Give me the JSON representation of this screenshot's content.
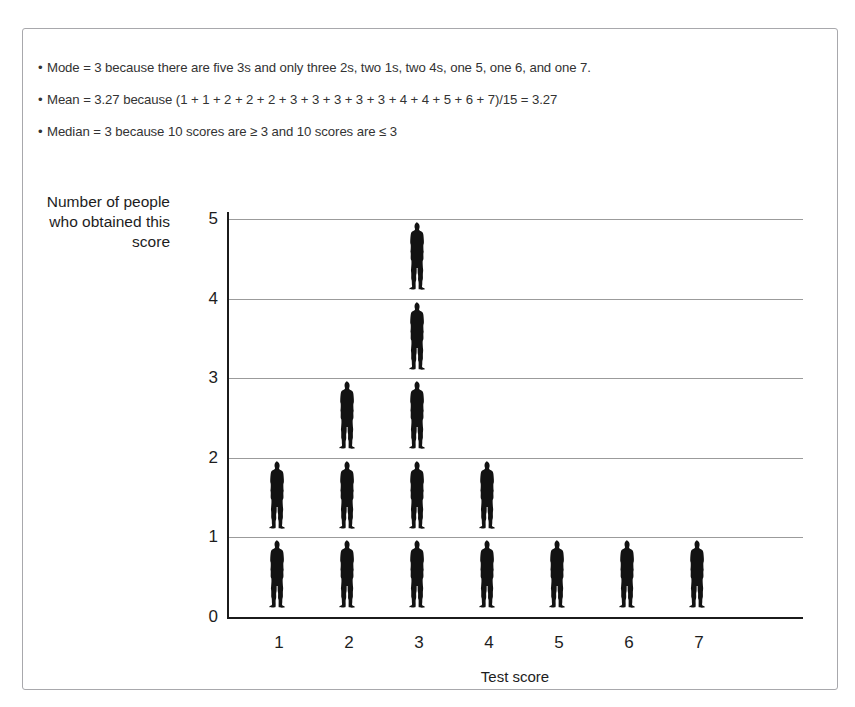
{
  "notes": {
    "bullet_char": "•",
    "items": [
      "Mode = 3 because there are five 3s and only three 2s, two 1s, two 4s, one 5, one 6, and one 7.",
      "Mean = 3.27 because (1 + 1 + 2 + 2 + 2 + 3 + 3 + 3 + 3 + 3 + 4 + 4 + 5 + 6 + 7)/15 = 3.27",
      "Median = 3 because 10 scores are ≥  3 and 10 scores are ≤ 3"
    ]
  },
  "chart_data": {
    "type": "bar",
    "subtype": "pictogram",
    "title": "",
    "xlabel": "Test score",
    "ylabel": "Number of people who obtained this score",
    "categories": [
      "1",
      "2",
      "3",
      "4",
      "5",
      "6",
      "7"
    ],
    "values": [
      2,
      3,
      5,
      2,
      1,
      1,
      1
    ],
    "ylim": [
      0,
      5
    ],
    "yticks": [
      "0",
      "1",
      "2",
      "3",
      "4",
      "5"
    ],
    "grid": true,
    "legend": "none",
    "icon_unit": 1,
    "icon_name": "person-icon",
    "icon_color": "#121212",
    "axis_color": "#1b1b1b",
    "grid_color": "#9b9b9b"
  },
  "colors": {
    "page_background": "#ffffff",
    "border": "#a8a8ac",
    "text": "#333333",
    "axis_text": "#1d1d1d"
  }
}
